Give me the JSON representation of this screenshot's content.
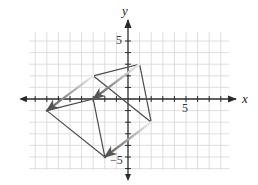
{
  "diagram": {
    "type": "coordinate-plane-translation",
    "colors": {
      "background": "#ffffff",
      "grid": "#d6d6d6",
      "axis": "#2a2a2a",
      "shape": "#4a4a4a",
      "arrow_start": "#e6e6e6",
      "arrow_end": "#555555"
    },
    "axes": {
      "x_label": "x",
      "y_label": "y",
      "x_tick_labels": [
        {
          "value": 5,
          "text": "5"
        }
      ],
      "y_tick_labels": [
        {
          "value": 5,
          "text": "5"
        },
        {
          "value": -5,
          "text": "−5"
        }
      ],
      "x_range": [
        -8,
        8
      ],
      "y_range": [
        -6,
        5
      ],
      "grid": true
    },
    "preimage": {
      "name": "original triangle",
      "vertices": [
        [
          -3,
          2
        ],
        [
          1,
          3
        ],
        [
          2,
          -2
        ]
      ]
    },
    "image": {
      "name": "translated triangle",
      "vertices": [
        [
          -7,
          -1
        ],
        [
          -3,
          0
        ],
        [
          -2,
          -5
        ]
      ]
    },
    "translation": {
      "vector": [
        -4,
        -3
      ],
      "arrows": [
        {
          "from": [
            -3,
            2
          ],
          "to": [
            -7,
            -1
          ]
        },
        {
          "from": [
            1,
            3
          ],
          "to": [
            -3,
            0
          ]
        },
        {
          "from": [
            2,
            -2
          ],
          "to": [
            -2,
            -5
          ]
        }
      ]
    }
  }
}
